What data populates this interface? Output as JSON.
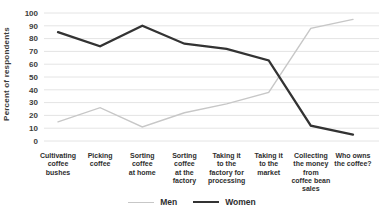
{
  "chart_data": {
    "type": "line",
    "title": "",
    "xlabel": "",
    "ylabel": "Percent of respondents",
    "ylim": [
      0,
      100
    ],
    "yticks": [
      0,
      10,
      20,
      30,
      40,
      50,
      60,
      70,
      80,
      90,
      100
    ],
    "grid": true,
    "legend_position": "bottom",
    "categories": [
      {
        "label": "Cultivating coffee bushes",
        "lines": [
          "Cultivating",
          "coffee",
          "bushes"
        ]
      },
      {
        "label": "Picking coffee",
        "lines": [
          "Picking",
          "coffee"
        ]
      },
      {
        "label": "Sorting coffee at home",
        "lines": [
          "Sorting",
          "coffee",
          "at home"
        ]
      },
      {
        "label": "Sorting coffee at the factory",
        "lines": [
          "Sorting",
          "coffee",
          "at the",
          "factory"
        ]
      },
      {
        "label": "Taking it to the factory for processing",
        "lines": [
          "Taking it",
          "to the",
          "factory for",
          "processing"
        ]
      },
      {
        "label": "Taking it to the market",
        "lines": [
          "Taking it",
          "to the",
          "market"
        ]
      },
      {
        "label": "Collecting the money from coffee bean sales",
        "lines": [
          "Collecting",
          "the money",
          "from",
          "coffee bean",
          "sales"
        ]
      },
      {
        "label": "Who owns the coffee?",
        "lines": [
          "Who owns",
          "the coffee?"
        ]
      }
    ],
    "series": [
      {
        "name": "Men",
        "color": "#c7c7c7",
        "stroke_width": 1.4,
        "values": [
          15,
          26,
          11,
          22,
          29,
          38,
          88,
          95
        ]
      },
      {
        "name": "Women",
        "color": "#333333",
        "stroke_width": 2.3,
        "values": [
          85,
          74,
          90,
          76,
          72,
          63,
          12,
          5
        ]
      }
    ]
  },
  "colors": {
    "background": "#ffffff",
    "gridline": "#e4e4e4",
    "tick_text": "#3d3d3d",
    "category_text": "#2e2e2e"
  }
}
